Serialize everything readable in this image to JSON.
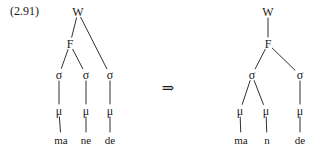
{
  "figure": {
    "example_number": "(2.91)",
    "transformation_arrow": "⇒",
    "ink_color": "#1a1a1a",
    "background_color": "#ffffff"
  },
  "left_tree": {
    "name": "input-prosodic-tree",
    "nodes": [
      {
        "id": "w",
        "label": "W",
        "x": 78,
        "y": 12
      },
      {
        "id": "f",
        "label": "F",
        "x": 70,
        "y": 44
      },
      {
        "id": "s1",
        "label": "σ",
        "x": 59,
        "y": 75
      },
      {
        "id": "s2",
        "label": "σ",
        "x": 86,
        "y": 75
      },
      {
        "id": "s3",
        "label": "σ",
        "x": 110,
        "y": 75
      },
      {
        "id": "m1",
        "label": "μ",
        "x": 59,
        "y": 111
      },
      {
        "id": "m2",
        "label": "μ",
        "x": 86,
        "y": 111
      },
      {
        "id": "m3",
        "label": "μ",
        "x": 110,
        "y": 111
      },
      {
        "id": "t1",
        "label": "ma",
        "x": 61,
        "y": 140
      },
      {
        "id": "t2",
        "label": "ne",
        "x": 86,
        "y": 140
      },
      {
        "id": "t3",
        "label": "de",
        "x": 110,
        "y": 140
      }
    ],
    "edges": [
      {
        "from": "w",
        "to": "f"
      },
      {
        "from": "w",
        "to": "s3"
      },
      {
        "from": "f",
        "to": "s1"
      },
      {
        "from": "f",
        "to": "s2"
      },
      {
        "from": "s1",
        "to": "m1"
      },
      {
        "from": "s2",
        "to": "m2"
      },
      {
        "from": "s3",
        "to": "m3"
      },
      {
        "from": "m1",
        "to": "t1"
      },
      {
        "from": "m2",
        "to": "t2"
      },
      {
        "from": "m3",
        "to": "t3"
      }
    ]
  },
  "right_tree": {
    "name": "output-prosodic-tree",
    "nodes": [
      {
        "id": "w",
        "label": "W",
        "x": 268,
        "y": 12
      },
      {
        "id": "f",
        "label": "F",
        "x": 268,
        "y": 44
      },
      {
        "id": "s1",
        "label": "σ",
        "x": 252,
        "y": 75
      },
      {
        "id": "s2",
        "label": "σ",
        "x": 300,
        "y": 75
      },
      {
        "id": "m1",
        "label": "μ",
        "x": 240,
        "y": 111
      },
      {
        "id": "m2",
        "label": "μ",
        "x": 266,
        "y": 111
      },
      {
        "id": "m3",
        "label": "μ",
        "x": 300,
        "y": 111
      },
      {
        "id": "t1",
        "label": "ma",
        "x": 241,
        "y": 140
      },
      {
        "id": "t2",
        "label": "n",
        "x": 267,
        "y": 140
      },
      {
        "id": "t3",
        "label": "de",
        "x": 300,
        "y": 140
      }
    ],
    "edges": [
      {
        "from": "w",
        "to": "f"
      },
      {
        "from": "f",
        "to": "s1"
      },
      {
        "from": "f",
        "to": "s2"
      },
      {
        "from": "s1",
        "to": "m1"
      },
      {
        "from": "s1",
        "to": "m2"
      },
      {
        "from": "s2",
        "to": "m3"
      },
      {
        "from": "m1",
        "to": "t1"
      },
      {
        "from": "m2",
        "to": "t2"
      },
      {
        "from": "m3",
        "to": "t3"
      }
    ]
  },
  "arrow": {
    "x": 168,
    "y": 88
  }
}
